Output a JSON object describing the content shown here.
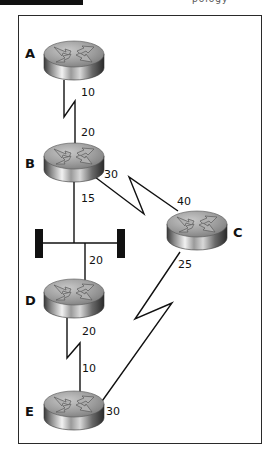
{
  "header": {
    "title_fragment": "pology"
  },
  "diagram": {
    "type": "network-topology",
    "routers": [
      {
        "id": "A",
        "label": "A",
        "x": 74,
        "y": 60
      },
      {
        "id": "B",
        "label": "B",
        "x": 74,
        "y": 160
      },
      {
        "id": "C",
        "label": "C",
        "x": 197,
        "y": 229
      },
      {
        "id": "D",
        "label": "D",
        "x": 74,
        "y": 297
      },
      {
        "id": "E",
        "label": "E",
        "x": 74,
        "y": 410
      }
    ],
    "ethernet_segment": {
      "label": "Ethernet",
      "connects": [
        "B",
        "D"
      ]
    },
    "links": [
      {
        "from": "A",
        "to": "B",
        "type": "serial",
        "cost_from": "10",
        "cost_to": "20"
      },
      {
        "from": "B",
        "to": "Ethernet",
        "type": "ethernet",
        "cost_from": "15"
      },
      {
        "from": "D",
        "to": "Ethernet",
        "type": "ethernet",
        "cost_from": "20"
      },
      {
        "from": "B",
        "to": "C",
        "type": "serial",
        "cost_from": "30",
        "cost_to": "40"
      },
      {
        "from": "D",
        "to": "E",
        "type": "serial",
        "cost_from": "20",
        "cost_to": "10"
      },
      {
        "from": "C",
        "to": "E",
        "type": "serial",
        "cost_from": "25",
        "cost_to": "30"
      }
    ],
    "costs": {
      "a_b_at_a": "10",
      "a_b_at_b": "20",
      "b_eth": "15",
      "b_c_at_b": "30",
      "b_c_at_c": "40",
      "d_eth": "20",
      "c_e_at_c": "25",
      "d_e_at_d": "20",
      "d_e_at_e": "10",
      "c_e_at_e": "30"
    }
  }
}
